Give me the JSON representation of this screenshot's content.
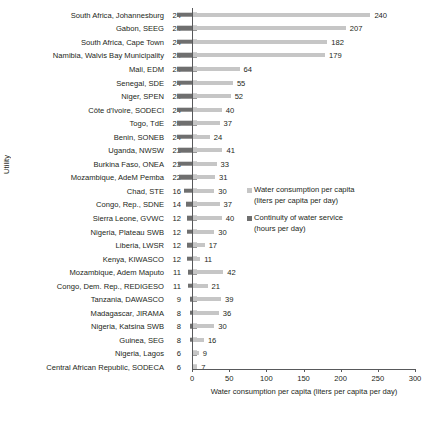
{
  "chart_data": {
    "type": "bar",
    "orientation": "horizontal",
    "title": "",
    "subtitle": "",
    "xlabel": "Water consumption per capita (liters per capita per day)",
    "ylabel": "Utility",
    "xlim": [
      0,
      300
    ],
    "xticks": [
      0,
      50,
      100,
      150,
      200,
      250,
      300
    ],
    "grid": false,
    "legend_position": "center-right",
    "categories": [
      "South Africa, Johannesburg",
      "Gabon, SEEG",
      "South Africa, Cape Town",
      "Namibia, Walvis Bay Municipality",
      "Mali, EDM",
      "Senegal, SDE",
      "Niger, SPEN",
      "Côte d'Ivoire, SODECI",
      "Togo, TdE",
      "Benin, SONEB",
      "Uganda, NWSW",
      "Burkina Faso, ONEA",
      "Mozambique, AdeM Pemba",
      "Chad, STE",
      "Congo, Rep., SDNE",
      "Sierra Leone, GVWC",
      "Nigeria, Plateau SWB",
      "Liberia, LWSR",
      "Kenya, KIWASCO",
      "Mozambique, Adem Maputo",
      "Congo, Dem. Rep., REDIGESO",
      "Tanzania, DAWASCO",
      "Madagascar, JIRAMA",
      "Nigeria, Katsina SWB",
      "Guinea, SEG",
      "Nigeria, Lagos",
      "Central African Republic, SODECA"
    ],
    "series": [
      {
        "name": "Water consumption per capita (liters per capita per day)",
        "color": "#c6c6c6",
        "values": [
          240,
          207,
          182,
          179,
          64,
          55,
          52,
          40,
          37,
          24,
          41,
          33,
          31,
          30,
          37,
          40,
          30,
          17,
          11,
          42,
          21,
          39,
          36,
          30,
          16,
          9,
          7
        ]
      },
      {
        "name": "Continuity of water service (hours per day)",
        "color": "#6f6f6f",
        "values": [
          24,
          24,
          24,
          24,
          24,
          24,
          24,
          24,
          24,
          24,
          23,
          23,
          22,
          16,
          14,
          12,
          12,
          12,
          12,
          11,
          11,
          9,
          8,
          8,
          8,
          6,
          6
        ]
      }
    ]
  },
  "legend": {
    "entries": [
      {
        "line1": "Water consumption per capita",
        "line2": "(liters per capita per day)",
        "color": "#c6c6c6"
      },
      {
        "line1": "Continuity of water service",
        "line2": "(hours per day)",
        "color": "#6f6f6f"
      }
    ]
  }
}
